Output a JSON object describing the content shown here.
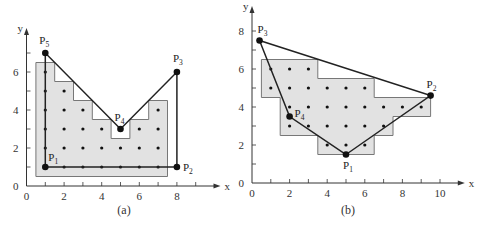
{
  "figure": {
    "panels": [
      {
        "id": "a",
        "caption": "(a)",
        "axes": {
          "x_label": "x",
          "y_label": "y",
          "x_ticks": [
            0,
            2,
            4,
            6,
            8
          ],
          "y_ticks": [
            0,
            2,
            4,
            6
          ],
          "x_max": 10,
          "y_max": 8
        },
        "vertices": [
          {
            "name": "P",
            "sub": "1",
            "x": 1,
            "y": 1
          },
          {
            "name": "P",
            "sub": "2",
            "x": 8,
            "y": 1
          },
          {
            "name": "P",
            "sub": "3",
            "x": 8,
            "y": 6
          },
          {
            "name": "P",
            "sub": "4",
            "x": 5,
            "y": 3
          },
          {
            "name": "P",
            "sub": "5",
            "x": 1,
            "y": 7
          }
        ],
        "shaded_region": [
          [
            0.5,
            0.5
          ],
          [
            7.5,
            0.5
          ],
          [
            7.5,
            4.5
          ],
          [
            6.5,
            4.5
          ],
          [
            6.5,
            3.5
          ],
          [
            5.5,
            3.5
          ],
          [
            5.5,
            2.5
          ],
          [
            4.5,
            2.5
          ],
          [
            4.5,
            3.5
          ],
          [
            3.5,
            3.5
          ],
          [
            3.5,
            4.5
          ],
          [
            2.5,
            4.5
          ],
          [
            2.5,
            5.5
          ],
          [
            1.5,
            5.5
          ],
          [
            1.5,
            6.5
          ],
          [
            0.5,
            6.5
          ]
        ],
        "interior_pixels": [
          [
            1,
            1
          ],
          [
            2,
            1
          ],
          [
            3,
            1
          ],
          [
            4,
            1
          ],
          [
            5,
            1
          ],
          [
            6,
            1
          ],
          [
            7,
            1
          ],
          [
            1,
            2
          ],
          [
            2,
            2
          ],
          [
            3,
            2
          ],
          [
            4,
            2
          ],
          [
            5,
            2
          ],
          [
            6,
            2
          ],
          [
            7,
            2
          ],
          [
            1,
            3
          ],
          [
            2,
            3
          ],
          [
            3,
            3
          ],
          [
            4,
            3
          ],
          [
            6,
            3
          ],
          [
            7,
            3
          ],
          [
            1,
            4
          ],
          [
            2,
            4
          ],
          [
            3,
            4
          ],
          [
            7,
            4
          ],
          [
            1,
            5
          ],
          [
            2,
            5
          ],
          [
            1,
            6
          ]
        ]
      },
      {
        "id": "b",
        "caption": "(b)",
        "axes": {
          "x_label": "x",
          "y_label": "y",
          "x_ticks": [
            0,
            2,
            4,
            6,
            8,
            10
          ],
          "y_ticks": [
            0,
            2,
            4,
            6,
            8
          ],
          "x_max": 11,
          "y_max": 9
        },
        "vertices": [
          {
            "name": "P",
            "sub": "1",
            "x": 5,
            "y": 1.5
          },
          {
            "name": "P",
            "sub": "2",
            "x": 9.5,
            "y": 4.6
          },
          {
            "name": "P",
            "sub": "3",
            "x": 0.4,
            "y": 7.5
          },
          {
            "name": "P",
            "sub": "4",
            "x": 2,
            "y": 3.5
          }
        ],
        "shaded_region": [
          [
            3.5,
            1.5
          ],
          [
            6.5,
            1.5
          ],
          [
            6.5,
            2.5
          ],
          [
            7.5,
            2.5
          ],
          [
            7.5,
            3.5
          ],
          [
            9.5,
            3.5
          ],
          [
            9.5,
            4.5
          ],
          [
            6.5,
            4.5
          ],
          [
            6.5,
            5.5
          ],
          [
            3.5,
            5.5
          ],
          [
            3.5,
            6.5
          ],
          [
            0.5,
            6.5
          ],
          [
            0.5,
            4.5
          ],
          [
            1.5,
            4.5
          ],
          [
            1.5,
            2.5
          ],
          [
            3.5,
            2.5
          ]
        ],
        "interior_pixels": [
          [
            4,
            2
          ],
          [
            5,
            2
          ],
          [
            6,
            2
          ],
          [
            2,
            3
          ],
          [
            3,
            3
          ],
          [
            4,
            3
          ],
          [
            5,
            3
          ],
          [
            6,
            3
          ],
          [
            7,
            3
          ],
          [
            2,
            4
          ],
          [
            3,
            4
          ],
          [
            4,
            4
          ],
          [
            5,
            4
          ],
          [
            6,
            4
          ],
          [
            7,
            4
          ],
          [
            8,
            4
          ],
          [
            9,
            4
          ],
          [
            1,
            5
          ],
          [
            2,
            5
          ],
          [
            3,
            5
          ],
          [
            4,
            5
          ],
          [
            5,
            5
          ],
          [
            6,
            5
          ],
          [
            1,
            6
          ],
          [
            2,
            6
          ],
          [
            3,
            6
          ]
        ]
      }
    ]
  }
}
